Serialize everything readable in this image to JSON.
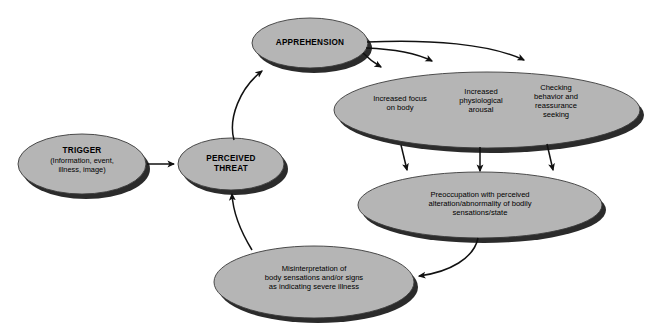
{
  "diagram": {
    "background_color": "#ffffff",
    "node_fill_color": "#b5b5b5",
    "node_shadow_color": "#2b2b2b",
    "node_stroke_color": "#3a3a3a",
    "arrow_color": "#111111",
    "nodes": [
      {
        "id": "trigger",
        "shape": "ellipse",
        "heading": "TRIGGER",
        "detail": "(Information, event,\nillness, image)",
        "cx": 82,
        "cy": 164,
        "rx": 64,
        "ry": 30
      },
      {
        "id": "perceived-threat",
        "shape": "ellipse",
        "heading": "PERCEIVED\nTHREAT",
        "detail": "",
        "cx": 231,
        "cy": 164,
        "rx": 53,
        "ry": 26
      },
      {
        "id": "apprehension",
        "shape": "ellipse",
        "heading": "APPREHENSION",
        "detail": "",
        "cx": 310,
        "cy": 43,
        "rx": 58,
        "ry": 25
      },
      {
        "id": "responses",
        "shape": "ellipse",
        "heading": "",
        "detail": "",
        "cx": 487,
        "cy": 110,
        "rx": 153,
        "ry": 38,
        "columns": [
          "Increased focus\non body",
          "Increased\nphysiological\narousal",
          "Checking\nbehavior and\nreassurance\nseeking"
        ]
      },
      {
        "id": "preoccupation",
        "shape": "ellipse",
        "heading": "",
        "detail": "Preoccupation with perceived\nalteration/abnormality of bodily\nsensations/state",
        "cx": 480,
        "cy": 205,
        "rx": 122,
        "ry": 33
      },
      {
        "id": "misinterpretation",
        "shape": "ellipse",
        "heading": "",
        "detail": "Misinterpretation of\nbody sensations and/or signs\nas indicating severe illness",
        "cx": 314,
        "cy": 282,
        "rx": 100,
        "ry": 36
      }
    ],
    "edges": [
      {
        "id": "trigger-to-threat",
        "from": "trigger",
        "to": "perceived-threat",
        "style": "straight"
      },
      {
        "id": "threat-to-apprehension",
        "from": "perceived-threat",
        "to": "apprehension",
        "style": "curved"
      },
      {
        "id": "apprehension-to-focus",
        "from": "apprehension",
        "to": "responses",
        "style": "curved"
      },
      {
        "id": "apprehension-to-arousal",
        "from": "apprehension",
        "to": "responses",
        "style": "curved"
      },
      {
        "id": "apprehension-to-checking",
        "from": "apprehension",
        "to": "responses",
        "style": "curved"
      },
      {
        "id": "focus-to-preoccupation",
        "from": "responses",
        "to": "preoccupation",
        "style": "straight"
      },
      {
        "id": "arousal-to-preoccupation",
        "from": "responses",
        "to": "preoccupation",
        "style": "straight"
      },
      {
        "id": "checking-to-preoccupation",
        "from": "responses",
        "to": "preoccupation",
        "style": "straight"
      },
      {
        "id": "preoccupation-to-misinterpretation",
        "from": "preoccupation",
        "to": "misinterpretation",
        "style": "curved"
      },
      {
        "id": "misinterpretation-to-threat",
        "from": "misinterpretation",
        "to": "perceived-threat",
        "style": "curved"
      }
    ]
  }
}
